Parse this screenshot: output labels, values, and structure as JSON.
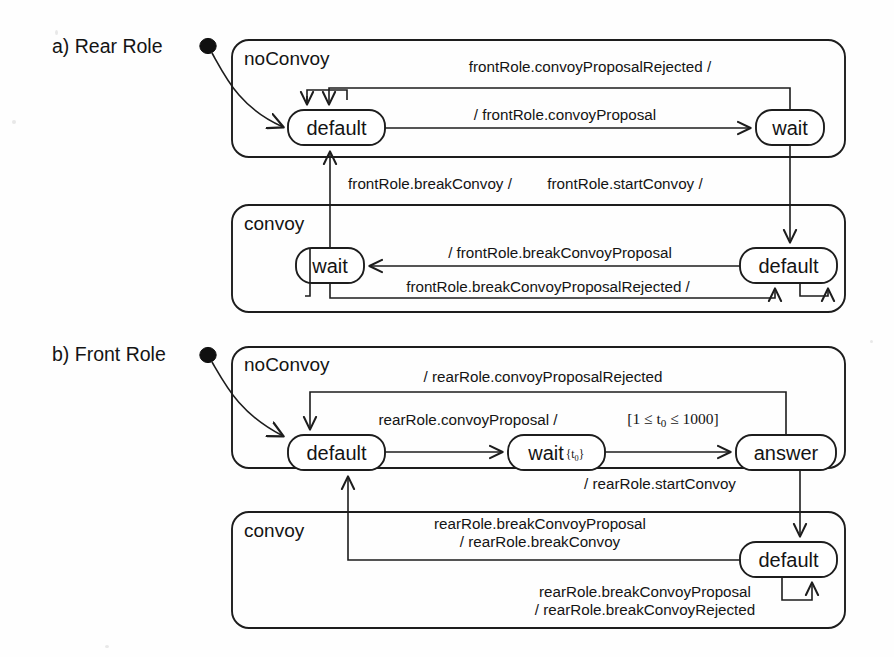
{
  "figure": {
    "type": "uml-state-machine-diagram",
    "background_color": "#fefefe",
    "line_color": "#1d1d1d"
  },
  "panels": [
    {
      "id": "a",
      "caption": "a) Rear Role",
      "initial_marker": "filled-circle",
      "regions": [
        {
          "id": "a-noconvoy",
          "label": "noConvoy",
          "states": [
            {
              "id": "a-nc-default",
              "label": "default"
            },
            {
              "id": "a-nc-wait",
              "label": "wait"
            }
          ]
        },
        {
          "id": "a-convoy",
          "label": "convoy",
          "states": [
            {
              "id": "a-c-wait",
              "label": "wait"
            },
            {
              "id": "a-c-default",
              "label": "default"
            }
          ]
        }
      ],
      "transitions": [
        {
          "id": "a-t1",
          "from": "a-nc-default",
          "to": "a-nc-wait",
          "label": "/ frontRole.convoyProposal"
        },
        {
          "id": "a-t2",
          "from": "a-nc-wait",
          "to": "a-nc-default",
          "label": "frontRole.convoyProposalRejected /"
        },
        {
          "id": "a-t3",
          "from": "a-nc-wait",
          "to": "a-c-default",
          "label": "frontRole.startConvoy /"
        },
        {
          "id": "a-t4",
          "from": "a-c-default",
          "to": "a-c-wait",
          "label": "/ frontRole.breakConvoyProposal"
        },
        {
          "id": "a-t5",
          "from": "a-c-wait",
          "to": "a-c-default",
          "label": "frontRole.breakConvoyProposalRejected /"
        },
        {
          "id": "a-t6",
          "from": "a-c-wait",
          "to": "a-nc-default",
          "label": "frontRole.breakConvoy /"
        }
      ]
    },
    {
      "id": "b",
      "caption": "b) Front Role",
      "initial_marker": "filled-circle",
      "regions": [
        {
          "id": "b-noconvoy",
          "label": "noConvoy",
          "states": [
            {
              "id": "b-nc-default",
              "label": "default"
            },
            {
              "id": "b-nc-wait",
              "label": "wait",
              "clock": "{t₀}"
            },
            {
              "id": "b-nc-answer",
              "label": "answer"
            }
          ]
        },
        {
          "id": "b-convoy",
          "label": "convoy",
          "states": [
            {
              "id": "b-c-default",
              "label": "default"
            }
          ]
        }
      ],
      "transitions": [
        {
          "id": "b-t1",
          "from": "b-nc-default",
          "to": "b-nc-wait",
          "label": "rearRole.convoyProposal /"
        },
        {
          "id": "b-t2",
          "from": "b-nc-wait",
          "to": "b-nc-answer",
          "guard": "[1 ≤ t₀ ≤ 1000]"
        },
        {
          "id": "b-t3",
          "from": "b-nc-answer",
          "to": "b-nc-default",
          "label": "/ rearRole.convoyProposalRejected"
        },
        {
          "id": "b-t4",
          "from": "b-nc-answer",
          "to": "b-c-default",
          "label": "/ rearRole.startConvoy"
        },
        {
          "id": "b-t5",
          "from": "b-c-default",
          "to": "b-nc-default",
          "label_line1": "rearRole.breakConvoyProposal",
          "label_line2": "/ rearRole.breakConvoy"
        },
        {
          "id": "b-t6",
          "from": "b-c-default",
          "to": "b-c-default",
          "label_line1": "rearRole.breakConvoyProposal",
          "label_line2": "/ rearRole.breakConvoyRejected"
        }
      ]
    }
  ],
  "guard_parts": {
    "b_t2_open": "[1 ",
    "b_t2_le1": "≤",
    "b_t2_var": " t",
    "b_t2_sub": "0",
    "b_t2_le2": " ≤ ",
    "b_t2_max": "1000]"
  },
  "clock_parts": {
    "open": "{t",
    "sub": "0",
    "close": "}"
  }
}
